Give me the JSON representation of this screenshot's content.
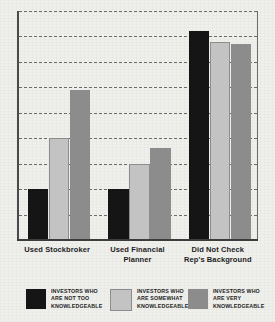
{
  "chart_data": {
    "type": "bar",
    "title": "",
    "subtitle": "",
    "xlabel": "",
    "ylabel": "",
    "ylim": [
      0,
      90
    ],
    "grid": true,
    "gridline_count": 9,
    "legend_position": "bottom",
    "categories": [
      "Used Stockbroker",
      "Used Financial\nPlanner",
      "Did Not Check\nRep's Background"
    ],
    "series": [
      {
        "name": "INVESTORS WHO\nARE NOT TOO\nKNOWLEDGEABLE",
        "color": "#151515",
        "values": [
          20,
          20,
          82
        ]
      },
      {
        "name": "INVESTORS WHO\nARE SOMEWHAT\nKNOWLEDGEABLE",
        "color": "#c3c3c3",
        "values": [
          40,
          30,
          78
        ]
      },
      {
        "name": "INVESTORS WHO\nARE VERY\nKNOWLEDGEABLE",
        "color": "#8c8c8c",
        "values": [
          59,
          36,
          77
        ]
      }
    ]
  },
  "axis": {
    "categories": [
      {
        "line1": "Used Stockbroker",
        "line2": ""
      },
      {
        "line1": "Used Financial",
        "line2": "Planner"
      },
      {
        "line1": "Did Not Check",
        "line2": "Rep's Background"
      }
    ]
  },
  "legend": {
    "items": [
      {
        "line1": "INVESTORS WHO",
        "line2": "ARE NOT TOO",
        "line3": "KNOWLEDGEABLE",
        "color": "#151515"
      },
      {
        "line1": "INVESTORS WHO",
        "line2": "ARE SOMEWHAT",
        "line3": "KNOWLEDGEABLE",
        "color": "#c3c3c3"
      },
      {
        "line1": "INVESTORS WHO",
        "line2": "ARE VERY",
        "line3": "KNOWLEDGEABLE",
        "color": "#8c8c8c"
      }
    ]
  },
  "colors": {
    "background": "#efefec",
    "axis": "#3c3c3c",
    "gridline": "#555555"
  }
}
